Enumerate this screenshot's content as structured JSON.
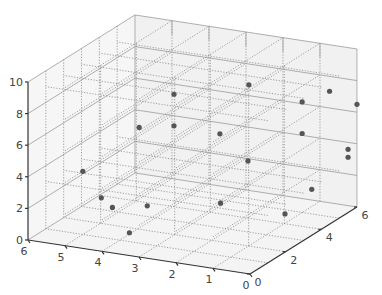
{
  "chart_data": {
    "type": "scatter3d",
    "title": "",
    "xlabel": "",
    "ylabel": "",
    "zlabel": "",
    "xlim": [
      0,
      6
    ],
    "ylim": [
      0,
      6
    ],
    "zlim": [
      0,
      10
    ],
    "x_ticks": [
      0,
      1,
      2,
      3,
      4,
      5,
      6
    ],
    "y_ticks": [
      0,
      2,
      4,
      6
    ],
    "z_ticks": [
      0,
      2,
      4,
      6,
      8,
      10
    ],
    "grid": true,
    "legend": null,
    "marker_color": "#555555",
    "points": [
      {
        "x": 3.5,
        "y": 3.0,
        "z": 8.0
      },
      {
        "x": 4.2,
        "y": 2.5,
        "z": 6.0
      },
      {
        "x": 3.5,
        "y": 3.0,
        "z": 6.0
      },
      {
        "x": 2.2,
        "y": 4.5,
        "z": 8.0
      },
      {
        "x": 2.5,
        "y": 3.5,
        "z": 5.5
      },
      {
        "x": 1.5,
        "y": 3.0,
        "z": 4.5
      },
      {
        "x": 5.0,
        "y": 1.0,
        "z": 4.0
      },
      {
        "x": 4.5,
        "y": 1.0,
        "z": 2.5
      },
      {
        "x": 4.2,
        "y": 1.0,
        "z": 2.0
      },
      {
        "x": 3.5,
        "y": 1.5,
        "z": 2.0
      },
      {
        "x": 2.0,
        "y": 2.5,
        "z": 2.0
      },
      {
        "x": 3.5,
        "y": 0.5,
        "z": 1.0
      },
      {
        "x": 1.0,
        "y": 5.0,
        "z": 7.0
      },
      {
        "x": 0.5,
        "y": 5.5,
        "z": 7.5
      },
      {
        "x": 0.0,
        "y": 6.0,
        "z": 6.5
      },
      {
        "x": 1.0,
        "y": 5.0,
        "z": 5.0
      },
      {
        "x": 0.0,
        "y": 5.5,
        "z": 4.0
      },
      {
        "x": 0.0,
        "y": 5.5,
        "z": 3.5
      },
      {
        "x": 0.5,
        "y": 4.5,
        "z": 2.0
      },
      {
        "x": 0.5,
        "y": 3.0,
        "z": 1.5
      }
    ]
  },
  "axes": {
    "x_tick_labels": [
      "0",
      "1",
      "2",
      "3",
      "4",
      "5",
      "6"
    ],
    "y_tick_labels": [
      "0",
      "2",
      "4",
      "6"
    ],
    "z_tick_labels": [
      "0",
      "2",
      "4",
      "6",
      "8",
      "10"
    ]
  }
}
